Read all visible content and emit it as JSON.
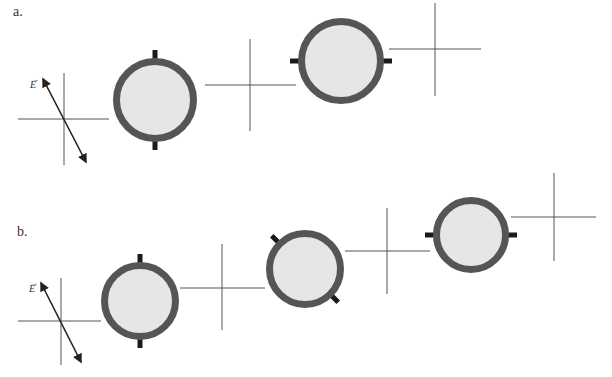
{
  "figure": {
    "panels": [
      {
        "id": "a",
        "label": "a.",
        "label_pos": [
          13,
          6
        ],
        "e_field": {
          "label": "E",
          "vector_mark": "→",
          "label_pos": [
            30,
            76
          ],
          "arrow": {
            "x1": 43,
            "y1": 79,
            "x2": 86,
            "y2": 162
          }
        },
        "axes": [
          {
            "cx": 64,
            "cy": 119,
            "x1": 18,
            "x2": 109,
            "y1": 73,
            "y2": 165
          },
          {
            "cx": 250,
            "cy": 85,
            "x1": 205,
            "x2": 296,
            "y1": 39,
            "y2": 131
          },
          {
            "cx": 435,
            "cy": 49,
            "x1": 389,
            "x2": 481,
            "y1": 3,
            "y2": 96
          }
        ],
        "polarizers": [
          {
            "cx": 155,
            "cy": 100,
            "r": 42,
            "axis_angle_deg": 90,
            "orientation": "vertical"
          },
          {
            "cx": 341,
            "cy": 61,
            "r": 43,
            "axis_angle_deg": 0,
            "orientation": "horizontal"
          }
        ]
      },
      {
        "id": "b",
        "label": "b.",
        "label_pos": [
          17,
          226
        ],
        "e_field": {
          "label": "E",
          "vector_mark": "→",
          "label_pos": [
            28,
            280
          ],
          "arrow": {
            "x1": 41,
            "y1": 283,
            "x2": 81,
            "y2": 362
          }
        },
        "axes": [
          {
            "cx": 61,
            "cy": 321,
            "x1": 18,
            "x2": 101,
            "y1": 278,
            "y2": 365
          },
          {
            "cx": 222,
            "cy": 288,
            "x1": 180,
            "x2": 265,
            "y1": 244,
            "y2": 330
          },
          {
            "cx": 387,
            "cy": 251,
            "x1": 345,
            "x2": 430,
            "y1": 208,
            "y2": 294
          },
          {
            "cx": 554,
            "cy": 217,
            "x1": 511,
            "x2": 596,
            "y1": 173,
            "y2": 261
          }
        ],
        "polarizers": [
          {
            "cx": 140,
            "cy": 301,
            "r": 39,
            "axis_angle_deg": 90,
            "orientation": "vertical"
          },
          {
            "cx": 305,
            "cy": 269,
            "r": 39,
            "axis_angle_deg": 135,
            "orientation": "diagonal-45"
          },
          {
            "cx": 471,
            "cy": 235,
            "r": 38,
            "axis_angle_deg": 0,
            "orientation": "horizontal"
          }
        ]
      }
    ],
    "colors": {
      "background": "#ffffff",
      "axis_line": "#555555",
      "arrow": "#222222",
      "ring": "#555555",
      "disc_fill": "#e6e6e6",
      "tab": "#1a1a1a",
      "text": "#333333"
    }
  }
}
